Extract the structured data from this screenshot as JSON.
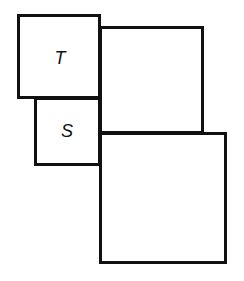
{
  "diagram": {
    "type": "square-arrangement",
    "stroke_color": "#111111",
    "background": "#ffffff",
    "shapes": [
      {
        "id": "square-t",
        "label": "T",
        "x": 17,
        "y": 14,
        "w": 84,
        "h": 85
      },
      {
        "id": "square-upper-right",
        "label": "",
        "x": 99,
        "y": 26,
        "w": 105,
        "h": 108
      },
      {
        "id": "square-s",
        "label": "S",
        "x": 34,
        "y": 97,
        "w": 67,
        "h": 69
      },
      {
        "id": "square-lower-right",
        "label": "",
        "x": 99,
        "y": 132,
        "w": 128,
        "h": 132
      }
    ],
    "labels": {
      "t": "T",
      "s": "S"
    }
  }
}
